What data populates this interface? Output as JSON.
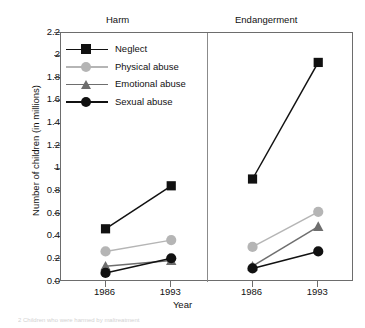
{
  "chart_data": {
    "type": "line",
    "title": "",
    "xlabel": "Year",
    "ylabel": "Number of children (in millions)",
    "panels": [
      {
        "label": "Harm",
        "x": [
          "1986",
          "1993"
        ],
        "series": [
          {
            "name": "Neglect",
            "values": [
              0.47,
              0.85
            ],
            "color": "#111111",
            "marker": "square"
          },
          {
            "name": "Physical abuse",
            "values": [
              0.27,
              0.37
            ],
            "color": "#b5b5b5",
            "marker": "circle"
          },
          {
            "name": "Emotional abuse",
            "values": [
              0.14,
              0.19
            ],
            "color": "#6e6e6e",
            "marker": "triangle"
          },
          {
            "name": "Sexual abuse",
            "values": [
              0.08,
              0.21
            ],
            "color": "#111111",
            "marker": "circle"
          }
        ]
      },
      {
        "label": "Endangerment",
        "x": [
          "1986",
          "1993"
        ],
        "series": [
          {
            "name": "Neglect",
            "values": [
              0.91,
              1.94
            ],
            "color": "#111111",
            "marker": "square"
          },
          {
            "name": "Physical abuse",
            "values": [
              0.31,
              0.62
            ],
            "color": "#b5b5b5",
            "marker": "circle"
          },
          {
            "name": "Emotional abuse",
            "values": [
              0.14,
              0.49
            ],
            "color": "#6e6e6e",
            "marker": "triangle"
          },
          {
            "name": "Sexual abuse",
            "values": [
              0.12,
              0.27
            ],
            "color": "#111111",
            "marker": "circle"
          }
        ]
      }
    ],
    "ylim": [
      0,
      2.2
    ],
    "yticks": [
      "0.0",
      "0.2",
      "0.4",
      "0.6",
      "0.8",
      "1",
      "1.2",
      "1.4",
      "1.6",
      "1.8",
      "2",
      "2.2"
    ],
    "ytick_values": [
      0,
      0.2,
      0.4,
      0.6,
      0.8,
      1,
      1.2,
      1.4,
      1.6,
      1.8,
      2,
      2.2
    ],
    "grid": false,
    "legend_position": "top-left",
    "legend": [
      {
        "label": "Neglect",
        "color": "#111111",
        "marker": "square"
      },
      {
        "label": "Physical abuse",
        "color": "#b5b5b5",
        "marker": "circle"
      },
      {
        "label": "Emotional abuse",
        "color": "#6e6e6e",
        "marker": "triangle"
      },
      {
        "label": "Sexual abuse",
        "color": "#111111",
        "marker": "circle"
      }
    ]
  },
  "footer": {
    "caption": "2 Children who were harmed by maltreatment"
  }
}
